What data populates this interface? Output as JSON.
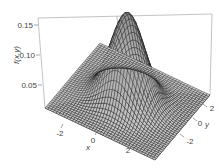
{
  "chart_data": {
    "type": "surface3d",
    "title": "",
    "function": "bivariate standard normal density f(x,y) = exp(-(x^2+y^2)/2) / (2*pi)",
    "xlabel": "x",
    "ylabel": "y",
    "zlabel": "f(x,y)",
    "x_ticks": [
      "-2",
      "0",
      "2"
    ],
    "y_ticks": [
      "-2",
      "0",
      "2"
    ],
    "z_ticks": [
      "0.05",
      "0.10",
      "0.15"
    ],
    "xlim": [
      -3.5,
      3.5
    ],
    "ylim": [
      -3.5,
      3.5
    ],
    "zlim": [
      0,
      0.16
    ],
    "peak": {
      "x": 0,
      "y": 0,
      "z": 0.159
    },
    "grid": false,
    "box": true,
    "surface_color": "#333333",
    "mesh_color": "#111111"
  }
}
